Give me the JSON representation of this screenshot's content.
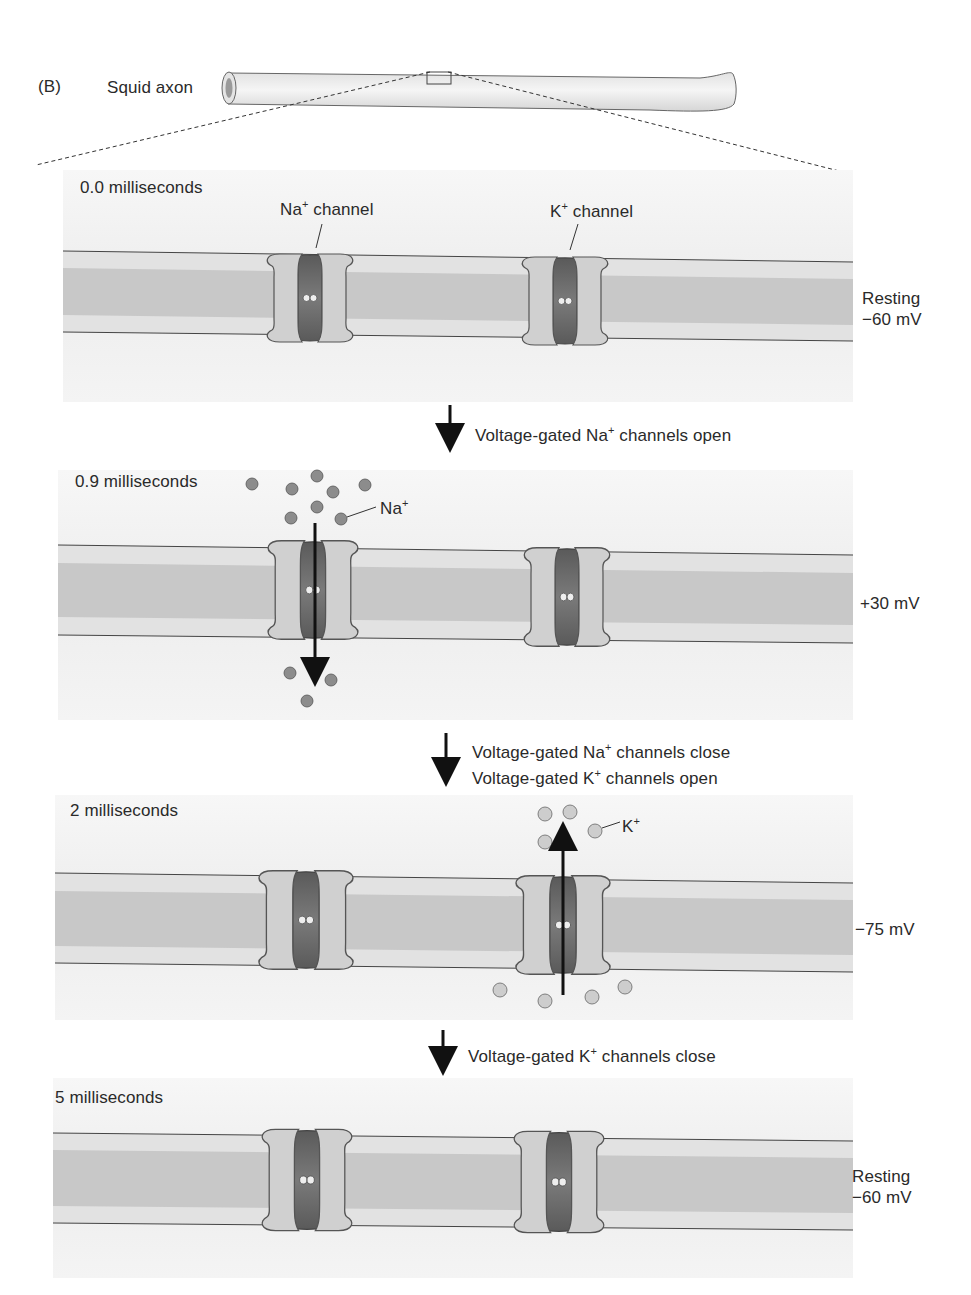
{
  "figure": {
    "panel_letter": "(B)",
    "axon_label": "Squid axon"
  },
  "stages": [
    {
      "time_label": "0.0 milliseconds",
      "potential_line1": "Resting",
      "potential_line2": "−60 mV",
      "na_channel_label": "Na",
      "k_channel_label": "K",
      "channel_word": "channel",
      "sup": "+"
    },
    {
      "time_label": "0.9 milliseconds",
      "potential_line1": "",
      "potential_line2": "+30 mV",
      "ion_label": "Na",
      "sup": "+"
    },
    {
      "time_label": "2 milliseconds",
      "potential_line1": "",
      "potential_line2": "−75 mV",
      "ion_label": "K",
      "sup": "+"
    },
    {
      "time_label": "5 milliseconds",
      "potential_line1": "Resting",
      "potential_line2": "−60 mV"
    }
  ],
  "transitions": [
    {
      "lines": [
        {
          "pre": "Voltage-gated Na",
          "sup": "+",
          "post": " channels open"
        }
      ]
    },
    {
      "lines": [
        {
          "pre": "Voltage-gated Na",
          "sup": "+",
          "post": " channels close"
        },
        {
          "pre": "Voltage-gated K",
          "sup": "+",
          "post": " channels open"
        }
      ]
    },
    {
      "lines": [
        {
          "pre": "Voltage-gated K",
          "sup": "+",
          "post": " channels close"
        }
      ]
    }
  ],
  "colors": {
    "panel_bg": "#ececec",
    "membrane_light": "#e0e0e0",
    "membrane_core": "#c9c9c9",
    "channel_subunit": "#cfcfcf",
    "channel_pore": "#6f6f6f",
    "na_ion": "#8a8a8a",
    "k_ion": "#c8c8c8"
  }
}
